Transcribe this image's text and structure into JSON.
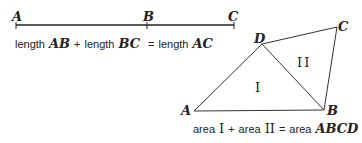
{
  "segment_diagram": {
    "points": {
      "A": "A",
      "B": "B",
      "C": "C"
    },
    "caption": {
      "part1_word": "length",
      "part1_var": "AB",
      "plus": "+",
      "part2_word": "length",
      "part2_var": "BC",
      "equals": "=",
      "part3_word": "length",
      "part3_var": "AC"
    }
  },
  "quad_diagram": {
    "points": {
      "A": "A",
      "B": "B",
      "C": "C",
      "D": "D"
    },
    "regions": {
      "one": "I",
      "two": "II"
    },
    "caption": {
      "part1_word": "area",
      "part1_var": "I",
      "plus": "+",
      "part2_word": "area",
      "part2_var": "II",
      "equals": "=",
      "part3_word": "area",
      "part3_var": "ABCD"
    }
  }
}
